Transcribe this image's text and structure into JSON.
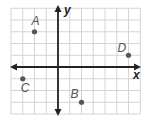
{
  "diagram": {
    "type": "coordinate-plane",
    "grid": {
      "x_min": -4,
      "x_max": 7,
      "y_min": -4,
      "y_max": 5,
      "cell_px": 11.75,
      "origin_px": [
        58,
        67
      ],
      "color": "#d4d4d4"
    },
    "axes": {
      "x_label": "x",
      "y_label": "y",
      "color": "#222222"
    },
    "points": [
      {
        "label": "A",
        "x": -2,
        "y": 3
      },
      {
        "label": "B",
        "x": 2,
        "y": -3
      },
      {
        "label": "C",
        "x": -3,
        "y": -1
      },
      {
        "label": "D",
        "x": 6,
        "y": 1
      }
    ],
    "point_color": "#555555"
  }
}
